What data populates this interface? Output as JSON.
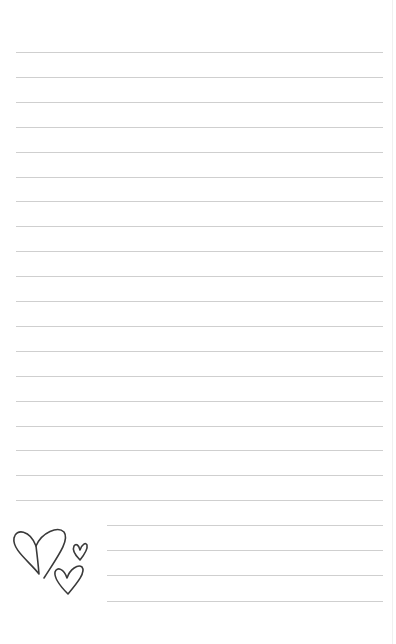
{
  "page": {
    "type": "lined-notepaper",
    "line_color": "#cfcfcf",
    "background": "#ffffff",
    "full_lines": {
      "count": 19,
      "x_start": 16,
      "x_end": 383,
      "y_first": 52,
      "spacing": 24.9
    },
    "short_lines": {
      "count": 4,
      "x_start": 107,
      "x_end": 383,
      "y_values": [
        525,
        550,
        575,
        601
      ]
    }
  },
  "decoration": {
    "icon": "hearts-doodle-icon",
    "stroke_color": "#3a3a3a",
    "hearts": [
      "large",
      "small",
      "medium"
    ]
  }
}
